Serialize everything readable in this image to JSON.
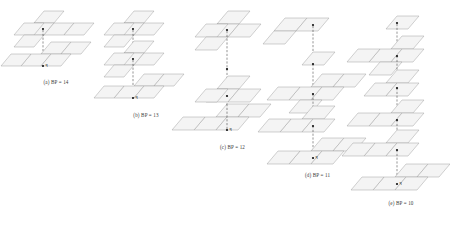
{
  "figure": {
    "kind": "lattice-stack-diagram",
    "panel_count": 5,
    "colors": {
      "cell_fill": "#f4f4f4",
      "cell_stroke": "#9a9a9a",
      "dash_line": "#2b2b2b",
      "node": "#111111",
      "caption_text": "#3a3a3a",
      "background": "#ffffff"
    },
    "node_label": "q",
    "panels": [
      {
        "id": "a",
        "caption": "(a) BP = 14",
        "bp_value": 14,
        "level_count": 2,
        "levels": [
          {
            "index": 0,
            "shape": "plus",
            "offset_x": 0,
            "offset_y": 0
          },
          {
            "index": 1,
            "shape": "plus",
            "offset_x": 0,
            "offset_y": 52
          }
        ]
      },
      {
        "id": "b",
        "caption": "(b) BP = 13",
        "bp_value": 13,
        "level_count": 3,
        "levels": [
          {
            "index": 0,
            "shape": "plus",
            "offset_x": 0,
            "offset_y": 0
          },
          {
            "index": 1,
            "shape": "plus",
            "offset_x": 0,
            "offset_y": 40
          },
          {
            "index": 2,
            "shape": "plus",
            "offset_x": 0,
            "offset_y": 80
          }
        ]
      },
      {
        "id": "c",
        "caption": "(c) BP = 12",
        "bp_value": 12,
        "level_count": 3,
        "levels": [
          {
            "index": 0,
            "shape": "plus",
            "offset_x": 0,
            "offset_y": 0
          },
          {
            "index": 1,
            "shape": "plus",
            "offset_x": 0,
            "offset_y": 72
          },
          {
            "index": 2,
            "shape": "plus",
            "offset_x": 0,
            "offset_y": 104
          }
        ]
      },
      {
        "id": "d",
        "caption": "(d) BP = 11",
        "bp_value": 11,
        "level_count": 5,
        "levels": [
          {
            "index": 0,
            "shape": "bar2",
            "offset_x": 0,
            "offset_y": 0
          },
          {
            "index": 1,
            "shape": "single",
            "offset_x": 0,
            "offset_y": 34
          },
          {
            "index": 2,
            "shape": "plus",
            "offset_x": 0,
            "offset_y": 58
          },
          {
            "index": 3,
            "shape": "plus",
            "offset_x": 0,
            "offset_y": 88
          },
          {
            "index": 4,
            "shape": "plus",
            "offset_x": 0,
            "offset_y": 118
          }
        ]
      },
      {
        "id": "e",
        "caption": "(e) BP = 10",
        "bp_value": 10,
        "level_count": 6,
        "levels": [
          {
            "index": 0,
            "shape": "single",
            "offset_x": 0,
            "offset_y": 0
          },
          {
            "index": 1,
            "shape": "plus",
            "offset_x": 0,
            "offset_y": 26
          },
          {
            "index": 2,
            "shape": "plus",
            "offset_x": 0,
            "offset_y": 60
          },
          {
            "index": 3,
            "shape": "plus",
            "offset_x": 0,
            "offset_y": 92
          },
          {
            "index": 4,
            "shape": "plus",
            "offset_x": 0,
            "offset_y": 124
          },
          {
            "index": 5,
            "shape": "plus",
            "offset_x": 0,
            "offset_y": 154
          }
        ]
      }
    ]
  }
}
